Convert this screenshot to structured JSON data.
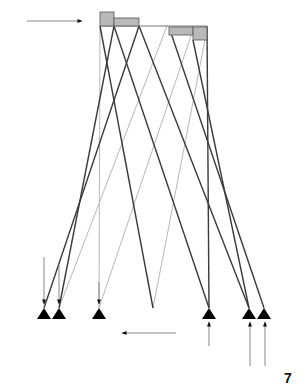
{
  "figure": {
    "label": "7"
  },
  "colors": {
    "member_dark": "#3a3a3a",
    "member_light": "#b8b8b8",
    "block_fill": "#b9b9b9",
    "block_stroke": "#555555",
    "support": "#000000",
    "arrow": "#222222"
  },
  "top_beam": {
    "x1": 100,
    "x2": 207,
    "y": 26
  },
  "blocks": [
    {
      "name": "block-a",
      "x": 100,
      "y": 12,
      "w": 14,
      "h": 14
    },
    {
      "name": "block-b",
      "x": 114,
      "y": 18,
      "w": 25,
      "h": 8
    },
    {
      "name": "block-c",
      "x": 169,
      "y": 27,
      "w": 24,
      "h": 8
    },
    {
      "name": "block-d",
      "x": 193,
      "y": 27,
      "w": 14,
      "h": 13
    }
  ],
  "supports": [
    {
      "name": "support-1",
      "x": 44,
      "y": 308
    },
    {
      "name": "support-2",
      "x": 59,
      "y": 308
    },
    {
      "name": "support-3",
      "x": 99,
      "y": 308
    },
    {
      "name": "support-4",
      "x": 209,
      "y": 308
    },
    {
      "name": "support-5",
      "x": 249,
      "y": 308
    },
    {
      "name": "support-6",
      "x": 264,
      "y": 308
    }
  ],
  "members_dark": [
    {
      "x1": 114,
      "y1": 26,
      "x2": 59,
      "y2": 308
    },
    {
      "x1": 139,
      "y1": 26,
      "x2": 44,
      "y2": 308
    },
    {
      "x1": 100,
      "y1": 26,
      "x2": 153,
      "y2": 308
    },
    {
      "x1": 114,
      "y1": 26,
      "x2": 209,
      "y2": 308
    },
    {
      "x1": 139,
      "y1": 26,
      "x2": 249,
      "y2": 308
    },
    {
      "x1": 170,
      "y1": 30,
      "x2": 264,
      "y2": 308
    },
    {
      "x1": 193,
      "y1": 40,
      "x2": 249,
      "y2": 308
    },
    {
      "x1": 207,
      "y1": 26,
      "x2": 209,
      "y2": 308
    }
  ],
  "members_light": [
    {
      "x1": 100,
      "y1": 26,
      "x2": 99,
      "y2": 308
    },
    {
      "x1": 167,
      "y1": 26,
      "x2": 59,
      "y2": 308
    },
    {
      "x1": 193,
      "y1": 30,
      "x2": 99,
      "y2": 308
    },
    {
      "x1": 205,
      "y1": 40,
      "x2": 153,
      "y2": 308
    }
  ],
  "arrows": [
    {
      "name": "load-arrow-top-right",
      "x1": 27,
      "y1": 21,
      "x2": 82,
      "y2": 21
    },
    {
      "name": "load-arrow-bottom-left",
      "x1": 176,
      "y1": 333,
      "x2": 122,
      "y2": 333
    },
    {
      "name": "down-arrow-support-1",
      "x1": 44,
      "y1": 257,
      "x2": 44,
      "y2": 304
    },
    {
      "name": "down-arrow-support-2",
      "x1": 59,
      "y1": 265,
      "x2": 59,
      "y2": 304
    },
    {
      "name": "down-arrow-support-3",
      "x1": 99,
      "y1": 282,
      "x2": 99,
      "y2": 304
    },
    {
      "name": "up-arrow-support-4",
      "x1": 209,
      "y1": 346,
      "x2": 209,
      "y2": 322
    },
    {
      "name": "up-arrow-support-5",
      "x1": 250,
      "y1": 366,
      "x2": 250,
      "y2": 322
    },
    {
      "name": "up-arrow-support-6",
      "x1": 265,
      "y1": 366,
      "x2": 265,
      "y2": 322
    }
  ]
}
